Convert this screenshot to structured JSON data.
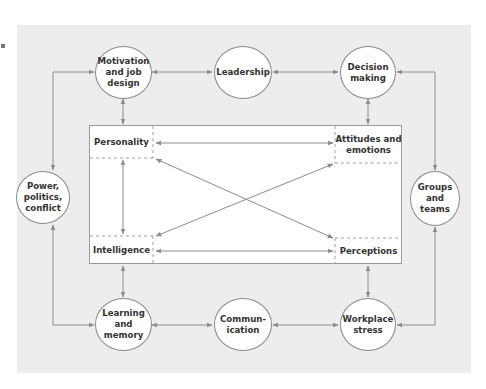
{
  "diagram": {
    "type": "relationship-diagram",
    "colors": {
      "background": "#ededed",
      "core_box": "#ffffff",
      "node_fill": "#ffffff",
      "line": "#8c8c8c",
      "text": "#333333"
    },
    "core": {
      "personality": "Personality",
      "attitudes": "Attitudes and\nemotions",
      "intelligence": "Intelligence",
      "perceptions": "Perceptions"
    },
    "nodes": {
      "motivation": "Motivation\nand job\ndesign",
      "leadership": "Leadership",
      "decision": "Decision\nmaking",
      "power": "Power,\npolitics,\nconflict",
      "groups": "Groups\nand\nteams",
      "learning": "Learning\nand\nmemory",
      "communication": "Commun-\nication",
      "stress": "Workplace\nstress"
    },
    "connections": [
      [
        "Motivation and job design",
        "Leadership"
      ],
      [
        "Leadership",
        "Decision making"
      ],
      [
        "Decision making",
        "Groups and teams"
      ],
      [
        "Groups and teams",
        "Workplace stress"
      ],
      [
        "Workplace stress",
        "Communication"
      ],
      [
        "Communication",
        "Learning and memory"
      ],
      [
        "Learning and memory",
        "Power, politics, conflict"
      ],
      [
        "Power, politics, conflict",
        "Motivation and job design"
      ],
      [
        "Motivation and job design",
        "Core box"
      ],
      [
        "Decision making",
        "Core box"
      ],
      [
        "Learning and memory",
        "Core box"
      ],
      [
        "Workplace stress",
        "Core box"
      ],
      [
        "Personality",
        "Attitudes and emotions"
      ],
      [
        "Personality",
        "Intelligence"
      ],
      [
        "Personality",
        "Perceptions"
      ],
      [
        "Intelligence",
        "Attitudes and emotions"
      ],
      [
        "Intelligence",
        "Perceptions"
      ]
    ]
  }
}
